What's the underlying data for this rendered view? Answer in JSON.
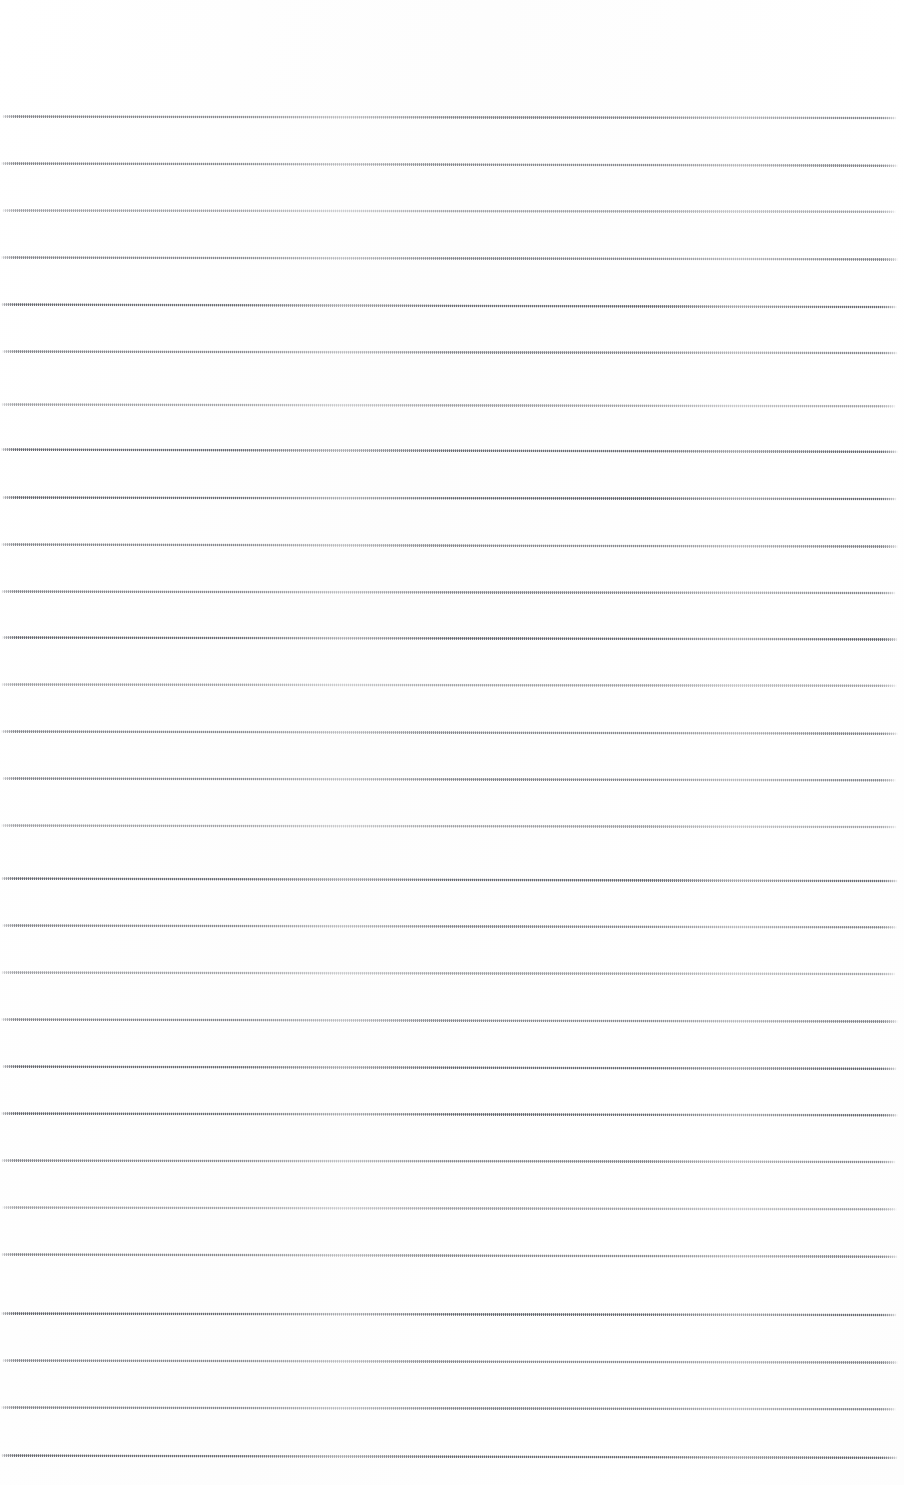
{
  "page": {
    "kind": "scanned-blank-ruled-paper",
    "width": 904,
    "height": 1485,
    "background_color": "#ffffff",
    "has_text": false,
    "has_margin_rule": false,
    "has_header": false,
    "has_footer": false,
    "has_page_number": false
  },
  "ruling": {
    "line_color": "#6e7076",
    "line_render": "dithered-halftone",
    "line_thickness_px": 3,
    "line_pitch_px": 47,
    "first_line_y_px": 116,
    "last_line_y_px": 1455,
    "line_left_x_px": 1,
    "line_right_x_px": 898,
    "line_count": 29,
    "top_margin_px": 116,
    "bottom_margin_px": 30,
    "skew_deg": 0.12,
    "lines": [
      {
        "y": 116,
        "density": "mid",
        "skew": 0.1,
        "x1": 2,
        "x2": 897
      },
      {
        "y": 163,
        "density": "mid",
        "skew": 0.14,
        "x1": 1,
        "x2": 898
      },
      {
        "y": 210,
        "density": "light",
        "skew": 0.08,
        "x1": 2,
        "x2": 896
      },
      {
        "y": 257,
        "density": "mid",
        "skew": 0.12,
        "x1": 1,
        "x2": 898
      },
      {
        "y": 304,
        "density": "dark",
        "skew": 0.16,
        "x1": 1,
        "x2": 897
      },
      {
        "y": 351,
        "density": "mid",
        "skew": 0.1,
        "x1": 2,
        "x2": 898
      },
      {
        "y": 404,
        "density": "light",
        "skew": 0.11,
        "x1": 1,
        "x2": 896
      },
      {
        "y": 449,
        "density": "dark",
        "skew": 0.15,
        "x1": 1,
        "x2": 898
      },
      {
        "y": 497,
        "density": "dark",
        "skew": 0.09,
        "x1": 2,
        "x2": 897
      },
      {
        "y": 544,
        "density": "mid",
        "skew": 0.13,
        "x1": 1,
        "x2": 898
      },
      {
        "y": 591,
        "density": "mid",
        "skew": 0.1,
        "x1": 1,
        "x2": 896
      },
      {
        "y": 637,
        "density": "dark",
        "skew": 0.12,
        "x1": 2,
        "x2": 898
      },
      {
        "y": 684,
        "density": "light",
        "skew": 0.08,
        "x1": 1,
        "x2": 897
      },
      {
        "y": 731,
        "density": "mid",
        "skew": 0.14,
        "x1": 1,
        "x2": 898
      },
      {
        "y": 778,
        "density": "mid",
        "skew": 0.11,
        "x1": 2,
        "x2": 896
      },
      {
        "y": 825,
        "density": "light",
        "skew": 0.09,
        "x1": 1,
        "x2": 897
      },
      {
        "y": 878,
        "density": "dark",
        "skew": 0.16,
        "x1": 1,
        "x2": 898
      },
      {
        "y": 925,
        "density": "mid",
        "skew": 0.12,
        "x1": 2,
        "x2": 897
      },
      {
        "y": 972,
        "density": "light",
        "skew": 0.1,
        "x1": 1,
        "x2": 896
      },
      {
        "y": 1019,
        "density": "mid",
        "skew": 0.13,
        "x1": 1,
        "x2": 898
      },
      {
        "y": 1066,
        "density": "dark",
        "skew": 0.15,
        "x1": 2,
        "x2": 897
      },
      {
        "y": 1113,
        "density": "dark",
        "skew": 0.11,
        "x1": 1,
        "x2": 898
      },
      {
        "y": 1160,
        "density": "mid",
        "skew": 0.09,
        "x1": 1,
        "x2": 896
      },
      {
        "y": 1207,
        "density": "light",
        "skew": 0.12,
        "x1": 2,
        "x2": 897
      },
      {
        "y": 1254,
        "density": "mid",
        "skew": 0.14,
        "x1": 1,
        "x2": 898
      },
      {
        "y": 1313,
        "density": "dark",
        "skew": 0.1,
        "x1": 1,
        "x2": 897
      },
      {
        "y": 1360,
        "density": "mid",
        "skew": 0.13,
        "x1": 2,
        "x2": 898
      },
      {
        "y": 1407,
        "density": "mid",
        "skew": 0.11,
        "x1": 1,
        "x2": 896
      },
      {
        "y": 1455,
        "density": "dark",
        "skew": 0.15,
        "x1": 1,
        "x2": 898
      }
    ]
  }
}
